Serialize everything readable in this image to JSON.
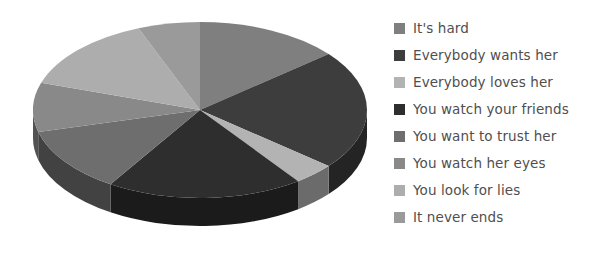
{
  "chart_data": {
    "type": "pie",
    "title": "",
    "subtitle": "",
    "xlabel": "",
    "ylabel": "",
    "legend_position": "right",
    "three_d": true,
    "start_angle_deg": 0,
    "direction": "clockwise",
    "categories": [
      "It's hard",
      "Everybody wants her",
      "Everybody loves her",
      "You watch your friends",
      "You want to trust her",
      "You watch her eyes",
      "You look for lies",
      "It never ends"
    ],
    "values": [
      14,
      22,
      4,
      19,
      12,
      9,
      14,
      6
    ],
    "slice_colors": [
      "#7f7f7f",
      "#3d3d3d",
      "#b3b3b3",
      "#2e2e2e",
      "#6e6e6e",
      "#898989",
      "#adadad",
      "#9a9a9a"
    ],
    "side_colors": [
      "#4d4d4d",
      "#242424",
      "#6b6b6b",
      "#1b1b1b",
      "#424242",
      "#525252",
      "#676767",
      "#5c5c5c"
    ],
    "angles_deg": [
      50.4,
      79.2,
      14.4,
      68.4,
      43.2,
      32.4,
      50.4,
      21.6
    ],
    "geometry": {
      "center_x": 200,
      "center_y": 110,
      "radius_x": 167,
      "radius_y": 88,
      "depth": 28
    }
  },
  "legend": {
    "items": [
      {
        "label": "It's hard",
        "color": "#7f7f7f"
      },
      {
        "label": "Everybody wants her",
        "color": "#3d3d3d"
      },
      {
        "label": "Everybody loves her",
        "color": "#b3b3b3"
      },
      {
        "label": "You watch your friends",
        "color": "#2e2e2e"
      },
      {
        "label": "You want to trust her",
        "color": "#6e6e6e"
      },
      {
        "label": "You watch her eyes",
        "color": "#898989"
      },
      {
        "label": "You look for lies",
        "color": "#adadad"
      },
      {
        "label": "It never ends",
        "color": "#9a9a9a"
      }
    ]
  },
  "colors": {
    "background": "#ffffff",
    "legend_text": "#4f4f4f"
  }
}
